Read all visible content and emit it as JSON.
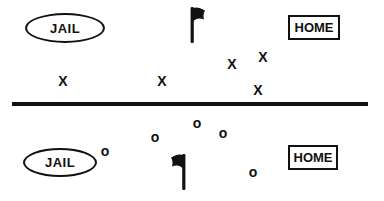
{
  "diagram": {
    "title_hint": "capture-the-flag field diagram",
    "colors": {
      "ink": "#111111",
      "background": "#ffffff"
    },
    "top_zone": {
      "jail_label": "JAIL",
      "home_label": "HOME",
      "flag_icon": "black-flag-icon",
      "player_marker": "X",
      "players": [
        {
          "x": 63,
          "y": 81
        },
        {
          "x": 162,
          "y": 81
        },
        {
          "x": 232,
          "y": 64
        },
        {
          "x": 263,
          "y": 57
        },
        {
          "x": 258,
          "y": 90
        }
      ]
    },
    "bottom_zone": {
      "jail_label": "JAIL",
      "home_label": "HOME",
      "flag_icon": "black-flag-icon-mirrored",
      "player_marker": "o",
      "players": [
        {
          "x": 105,
          "y": 151
        },
        {
          "x": 155,
          "y": 137
        },
        {
          "x": 197,
          "y": 123
        },
        {
          "x": 223,
          "y": 133
        },
        {
          "x": 253,
          "y": 172
        }
      ]
    }
  }
}
